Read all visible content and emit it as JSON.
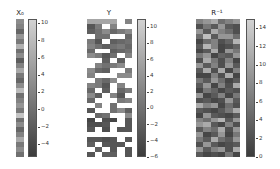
{
  "chart_data": [
    {
      "type": "heatmap",
      "title": "X_0",
      "title_display": "X₀",
      "rows": 28,
      "cols": 1,
      "colormap": "grayscale (dark=low, light=high)",
      "colorbar": {
        "min": -5.5,
        "max": 10.5,
        "ticks": [
          10,
          8,
          6,
          4,
          2,
          0,
          -2,
          -4
        ]
      },
      "values": [
        [
          3
        ],
        [
          2
        ],
        [
          -1
        ],
        [
          4
        ],
        [
          1
        ],
        [
          7
        ],
        [
          0
        ],
        [
          3
        ],
        [
          -2
        ],
        [
          2
        ],
        [
          6
        ],
        [
          1
        ],
        [
          -1
        ],
        [
          3
        ],
        [
          8
        ],
        [
          0
        ],
        [
          2
        ],
        [
          4
        ],
        [
          1
        ],
        [
          9
        ],
        [
          0
        ],
        [
          3
        ],
        [
          -1
        ],
        [
          2
        ],
        [
          6
        ],
        [
          1
        ],
        [
          3
        ],
        [
          0
        ]
      ]
    },
    {
      "type": "heatmap",
      "title": "Y",
      "title_display": "Y",
      "rows": 28,
      "cols": 6,
      "colormap": "grayscale (dark=low, light=high); white = missing",
      "colorbar": {
        "min": -6,
        "max": 11,
        "ticks": [
          10,
          8,
          6,
          4,
          2,
          0,
          -2,
          -4,
          -6
        ]
      },
      "values": [
        [
          6,
          6,
          6,
          6,
          null,
          2
        ],
        [
          -3,
          1,
          null,
          2,
          null,
          null
        ],
        [
          -2,
          0,
          3,
          -1,
          1,
          3
        ],
        [
          null,
          0,
          0,
          null,
          null,
          -1
        ],
        [
          1,
          -3,
          null,
          -2,
          -1,
          0
        ],
        [
          2,
          0,
          -2,
          0,
          1,
          -1
        ],
        [
          -1,
          null,
          null,
          -2,
          -1,
          0
        ],
        [
          3,
          1,
          -3,
          0,
          null,
          2
        ],
        [
          null,
          null,
          -2,
          null,
          -2,
          null
        ],
        [
          null,
          2,
          0,
          1,
          3,
          null
        ],
        [
          3,
          -1,
          -2,
          null,
          null,
          1
        ],
        [
          2,
          null,
          null,
          null,
          3,
          3
        ],
        [
          null,
          1,
          -1,
          3,
          null,
          null
        ],
        [
          2,
          1,
          -3,
          null,
          2,
          null
        ],
        [
          -1,
          null,
          -2,
          null,
          -1,
          1
        ],
        [
          3,
          -2,
          null,
          2,
          -3,
          null
        ],
        [
          -1,
          null,
          null,
          null,
          1,
          2
        ],
        [
          null,
          2,
          null,
          0,
          null,
          null
        ],
        [
          -3,
          null,
          null,
          0,
          3,
          -2
        ],
        [
          null,
          -1,
          0,
          null,
          null,
          3
        ],
        [
          -5,
          null,
          -4,
          -5,
          null,
          -3
        ],
        [
          -4,
          -4,
          -3,
          null,
          null,
          -3
        ],
        [
          -3,
          null,
          -4,
          null,
          -3,
          -3
        ],
        [
          null,
          null,
          null,
          null,
          null,
          null
        ],
        [
          -3,
          -3,
          -4,
          -3,
          null,
          -3
        ],
        [
          -2,
          null,
          -3,
          -3,
          -3,
          null
        ],
        [
          null,
          -2,
          null,
          -3,
          null,
          -3
        ],
        [
          -3,
          null,
          -2,
          -2,
          null,
          -3
        ]
      ]
    },
    {
      "type": "heatmap",
      "title": "R^-1",
      "title_display": "R⁻¹",
      "rows": 28,
      "cols": 6,
      "colormap": "grayscale (dark=low, light=high)",
      "colorbar": {
        "min": 0,
        "max": 15,
        "ticks": [
          14,
          12,
          10,
          8,
          6,
          4,
          2,
          0
        ]
      },
      "values": [
        [
          7,
          9,
          11,
          5,
          7,
          9
        ],
        [
          2,
          6,
          3,
          9,
          3,
          2
        ],
        [
          9,
          3,
          11,
          7,
          5,
          2
        ],
        [
          5,
          13,
          3,
          9,
          9,
          5
        ],
        [
          1,
          5,
          7,
          2,
          4,
          12
        ],
        [
          3,
          12,
          7,
          1,
          2,
          4
        ],
        [
          1,
          3,
          11,
          1,
          9,
          6
        ],
        [
          6,
          9,
          1,
          4,
          3,
          9
        ],
        [
          2,
          11,
          6,
          2,
          7,
          1
        ],
        [
          9,
          3,
          7,
          2,
          9,
          3
        ],
        [
          3,
          11,
          2,
          11,
          1,
          7
        ],
        [
          1,
          1,
          7,
          2,
          11,
          1
        ],
        [
          6,
          3,
          9,
          5,
          1,
          3
        ],
        [
          3,
          9,
          1,
          7,
          2,
          11
        ],
        [
          1,
          6,
          4,
          1,
          3,
          2
        ],
        [
          9,
          1,
          3,
          7,
          1,
          6
        ],
        [
          2,
          3,
          1,
          2,
          9,
          3
        ],
        [
          11,
          7,
          9,
          1,
          5,
          2
        ],
        [
          3,
          2,
          1,
          3,
          6,
          11
        ],
        [
          1,
          9,
          3,
          2,
          1,
          3
        ],
        [
          7,
          5,
          9,
          12,
          3,
          9
        ],
        [
          9,
          11,
          3,
          1,
          7,
          2
        ],
        [
          3,
          7,
          5,
          11,
          2,
          9
        ],
        [
          9,
          1,
          3,
          9,
          1,
          6
        ],
        [
          6,
          3,
          11,
          5,
          3,
          9
        ],
        [
          2,
          9,
          3,
          1,
          2,
          3
        ],
        [
          9,
          3,
          7,
          9,
          2,
          11
        ],
        [
          3,
          1,
          2,
          1,
          6,
          1
        ]
      ]
    }
  ],
  "panels": {
    "x0": {
      "title": "X₀",
      "ticks": [
        "10",
        "8",
        "6",
        "4",
        "2",
        "0",
        "−2",
        "−4"
      ]
    },
    "y": {
      "title": "Y",
      "ticks": [
        "10",
        "8",
        "6",
        "4",
        "2",
        "0",
        "−2",
        "−4",
        "−6"
      ]
    },
    "rinv": {
      "title": "R⁻¹",
      "ticks": [
        "14",
        "12",
        "10",
        "8",
        "6",
        "4",
        "2",
        "0"
      ]
    }
  }
}
